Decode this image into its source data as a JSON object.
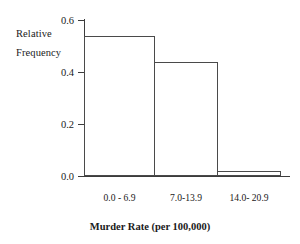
{
  "chart_data": {
    "type": "bar",
    "title": "",
    "subtitle": "",
    "categories": [
      "0.0 - 6.9",
      "7.0-13.9",
      "14.0- 20.9"
    ],
    "values": [
      0.54,
      0.44,
      0.02
    ],
    "xlabel": "Murder Rate (per 100,000)",
    "ylabel_line1": "Relative",
    "ylabel_line2": "Frequency",
    "ylabel": "Relative Frequency",
    "ylim": [
      0.0,
      0.6
    ],
    "ytick_labels": [
      "0.0",
      "0.2",
      "0.4",
      "0.6"
    ],
    "ytick_values": [
      0.0,
      0.2,
      0.4,
      0.6
    ],
    "grid": false,
    "legend": false,
    "legend_position": "none",
    "bar_style": "contiguous-histogram",
    "bar_fill_color": "#ffffff",
    "bar_edge_color": "#4a4a4a",
    "axis_color": "#3c3c3c",
    "background_color": "#ffffff"
  }
}
